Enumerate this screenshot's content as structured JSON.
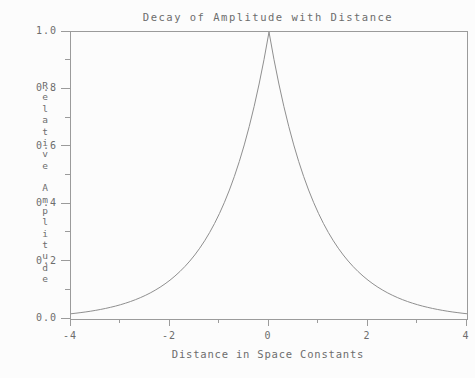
{
  "colors": {
    "background": "#fcfcfc",
    "ink": "#6d6d6d",
    "axis": "#9b9b9b",
    "curve": "#8f8f8f"
  },
  "chart_data": {
    "type": "line",
    "title": "Decay of Amplitude with Distance",
    "xlabel": "Distance in Space Constants",
    "ylabel": "Relative Amplitude",
    "xlim": [
      -4,
      4
    ],
    "ylim": [
      0.0,
      1.0
    ],
    "grid": false,
    "legend": null,
    "frame": "full-box",
    "x_major_ticks": [
      -4,
      -2,
      0,
      2,
      4
    ],
    "x_major_tick_labels": [
      "-4",
      "-2",
      "0",
      "2",
      "4"
    ],
    "x_minor_ticks": [
      -3,
      -1,
      1,
      3
    ],
    "y_major_ticks": [
      1.0,
      0.8,
      0.6,
      0.4,
      0.2,
      0.0
    ],
    "y_major_tick_labels": [
      "1.0",
      "0.8",
      "0.6",
      "0.4",
      "0.2",
      "0.0"
    ],
    "y_minor_ticks": [
      0.9,
      0.7,
      0.5,
      0.3,
      0.1
    ],
    "series": [
      {
        "name": "relative-amplitude",
        "formula": "y = exp(-|x|)",
        "symmetric_about_x0": true,
        "abs_x": [
          0.0,
          0.1,
          0.2,
          0.3,
          0.4,
          0.5,
          0.6,
          0.7,
          0.8,
          0.9,
          1.0,
          1.1,
          1.2,
          1.3,
          1.4,
          1.5,
          1.6,
          1.7,
          1.8,
          1.9,
          2.0,
          2.1,
          2.2,
          2.3,
          2.4,
          2.5,
          2.6,
          2.7,
          2.8,
          2.9,
          3.0,
          3.1,
          3.2,
          3.3,
          3.4,
          3.5,
          3.6,
          3.7,
          3.8,
          3.9,
          4.0
        ],
        "y": [
          1.0,
          0.9048,
          0.8187,
          0.7408,
          0.6703,
          0.6065,
          0.5488,
          0.4966,
          0.4493,
          0.4066,
          0.3679,
          0.3329,
          0.3012,
          0.2725,
          0.2466,
          0.2231,
          0.2019,
          0.1827,
          0.1653,
          0.1496,
          0.1353,
          0.1225,
          0.1108,
          0.1003,
          0.0907,
          0.0821,
          0.0743,
          0.0672,
          0.0608,
          0.055,
          0.0498,
          0.045,
          0.0408,
          0.0369,
          0.0334,
          0.0302,
          0.0273,
          0.0247,
          0.0224,
          0.0202,
          0.0183
        ]
      }
    ]
  }
}
